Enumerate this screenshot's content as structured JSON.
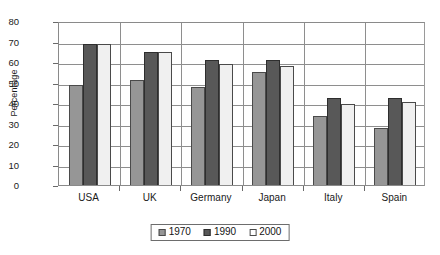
{
  "chart_data": {
    "type": "bar",
    "title": "",
    "subtitle": "",
    "xlabel": "",
    "ylabel": "Percentage",
    "ylim": [
      0,
      80
    ],
    "yticks": [
      0,
      10,
      20,
      30,
      40,
      50,
      60,
      70,
      80
    ],
    "ytick_labels": [
      "0",
      "10",
      "20",
      "30",
      "40",
      "50",
      "60",
      "70",
      "80"
    ],
    "grid": "horizontal",
    "legend_position": "bottom-center",
    "categories": [
      "USA",
      "UK",
      "Germany",
      "Japan",
      "Italy",
      "Spain"
    ],
    "series": [
      {
        "name": "1970",
        "color": "#969696",
        "values": [
          49,
          51,
          48,
          55,
          33.5,
          28
        ]
      },
      {
        "name": "1990",
        "color": "#585858",
        "values": [
          69,
          65,
          61,
          61,
          42.5,
          42.5
        ]
      },
      {
        "name": "2000",
        "color": "#f0f0f0",
        "values": [
          69,
          65,
          59,
          58,
          39.5,
          40.5
        ]
      }
    ]
  },
  "axis": {
    "y_title": "Percentage"
  },
  "legend": {
    "entries": [
      {
        "label": "1970",
        "swatch": "legend-swatch-1970"
      },
      {
        "label": "1990",
        "swatch": "legend-swatch-1990"
      },
      {
        "label": "2000",
        "swatch": "legend-swatch-2000"
      }
    ]
  },
  "colors": {
    "series_1970": "#969696",
    "series_1990": "#585858",
    "series_2000": "#f0f0f0",
    "gridline": "#8e8e8e",
    "axis": "#8a8a8a",
    "text": "#1a1a1a",
    "background": "#ffffff"
  }
}
